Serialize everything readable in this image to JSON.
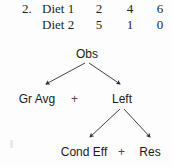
{
  "exercise": {
    "number": "2."
  },
  "table": {
    "rows": [
      {
        "label": "Diet 1",
        "values": [
          "2",
          "4",
          "6"
        ]
      },
      {
        "label": "Diet 2",
        "values": [
          "5",
          "1",
          "0"
        ]
      }
    ]
  },
  "tree": {
    "root": "Obs",
    "level_1": {
      "left_term": "Gr Avg",
      "operator": "+",
      "right_term": "Left"
    },
    "level_2": {
      "left_term": "Cond Eff",
      "operator": "+",
      "right_term": "Res"
    }
  },
  "style": {
    "ink_color": "#231f20",
    "node_color": "#1a1a1a",
    "arrow_color": "#2b2b2b",
    "background": "#fdfdfd"
  }
}
